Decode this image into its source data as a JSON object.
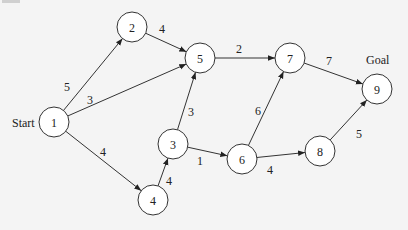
{
  "diagram": {
    "type": "directed-weighted-graph",
    "labels": {
      "start": "Start",
      "goal": "Goal"
    },
    "nodes": [
      {
        "id": "1",
        "label": "1",
        "x": 54,
        "y": 122
      },
      {
        "id": "2",
        "label": "2",
        "x": 132,
        "y": 27
      },
      {
        "id": "3",
        "label": "3",
        "x": 173,
        "y": 144
      },
      {
        "id": "4",
        "label": "4",
        "x": 153,
        "y": 200
      },
      {
        "id": "5",
        "label": "5",
        "x": 200,
        "y": 58
      },
      {
        "id": "6",
        "label": "6",
        "x": 242,
        "y": 159
      },
      {
        "id": "7",
        "label": "7",
        "x": 290,
        "y": 58
      },
      {
        "id": "8",
        "label": "8",
        "x": 320,
        "y": 151
      },
      {
        "id": "9",
        "label": "9",
        "x": 377,
        "y": 89
      }
    ],
    "edges": [
      {
        "from": "1",
        "to": "2",
        "weight": "5",
        "lx": 67,
        "ly": 87
      },
      {
        "from": "1",
        "to": "5",
        "weight": "3",
        "lx": 90,
        "ly": 100
      },
      {
        "from": "1",
        "to": "4",
        "weight": "4",
        "lx": 103,
        "ly": 152
      },
      {
        "from": "2",
        "to": "5",
        "weight": "4",
        "lx": 162,
        "ly": 29
      },
      {
        "from": "4",
        "to": "3",
        "weight": "4",
        "lx": 169,
        "ly": 181
      },
      {
        "from": "3",
        "to": "5",
        "weight": "3",
        "lx": 191,
        "ly": 112
      },
      {
        "from": "3",
        "to": "6",
        "weight": "1",
        "lx": 200,
        "ly": 161
      },
      {
        "from": "5",
        "to": "7",
        "weight": "2",
        "lx": 239,
        "ly": 49
      },
      {
        "from": "6",
        "to": "7",
        "weight": "6",
        "lx": 258,
        "ly": 111
      },
      {
        "from": "6",
        "to": "8",
        "weight": "4",
        "lx": 270,
        "ly": 170
      },
      {
        "from": "7",
        "to": "9",
        "weight": "7",
        "lx": 329,
        "ly": 61
      },
      {
        "from": "8",
        "to": "9",
        "weight": "5",
        "lx": 359,
        "ly": 134
      }
    ]
  }
}
